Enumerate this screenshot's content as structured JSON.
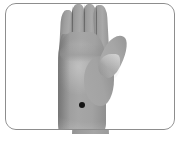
{
  "figure": {
    "kind": "acupuncture-point-photo",
    "caption": ""
  },
  "card": {
    "background_color": "#ffffff",
    "border_color": "#8d8d8d",
    "corner_radius_px": 11
  },
  "photo": {
    "colors": {
      "skin_mid": "#9e9e9e",
      "skin_light": "#aaaaaa",
      "skin_shadow": "#8a8a8a",
      "crease": "#5c5c5c",
      "background": "#ffffff"
    },
    "parts": [
      {
        "id": "finger-little",
        "label": "little finger"
      },
      {
        "id": "finger-ring",
        "label": "ring finger"
      },
      {
        "id": "finger-middle",
        "label": "middle finger"
      },
      {
        "id": "finger-index",
        "label": "index finger"
      },
      {
        "id": "thumb",
        "label": "thumb"
      },
      {
        "id": "palm",
        "label": "palm"
      },
      {
        "id": "thenar",
        "label": "thenar eminence"
      },
      {
        "id": "wrist",
        "label": "wrist"
      }
    ]
  },
  "markers": [
    {
      "id": "acupoint-1",
      "label": "",
      "color": "#141414",
      "shape": "filled-circle",
      "diameter_px": 6,
      "x_px": 76,
      "y_px": 101,
      "location_description": "ulnar side of the wrist, just proximal to the hypothenar border"
    }
  ]
}
